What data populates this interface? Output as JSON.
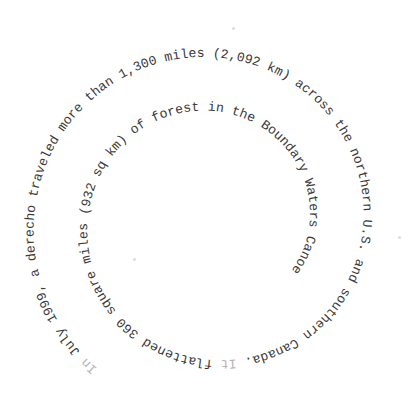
{
  "image": {
    "background": "#ffffff",
    "text_color": "#3a3a3a",
    "faded_color": "#b4b4b4"
  },
  "spiral": {
    "direction": "clockwise-inward",
    "segments": [
      {
        "text": "In ",
        "faded": true
      },
      {
        "text": "July 1999, a derecho traveled more than 1,300 miles (2,092 km) across the northern U.S. and southern Canada. ",
        "faded": false
      },
      {
        "text": "It ",
        "faded": true
      },
      {
        "text": "flattened 360 square miles (932 sq km) of forest in the Boundary Waters Canoe Area Wilderness of northern Minnesota.",
        "faded": false
      }
    ]
  }
}
